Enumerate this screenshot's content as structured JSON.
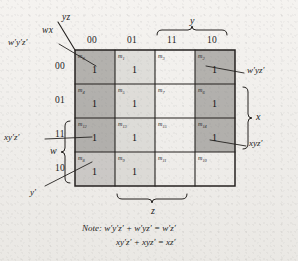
{
  "figure": {
    "type": "karnaugh-map",
    "variables": [
      "w",
      "x",
      "y",
      "z"
    ],
    "corner_label_top": "yz",
    "corner_label_bottom": "wx",
    "column_headers": [
      "00",
      "01",
      "11",
      "10"
    ],
    "row_headers": [
      "00",
      "01",
      "11",
      "10"
    ]
  },
  "braces": {
    "top": {
      "label": "y",
      "spans": [
        "11",
        "10"
      ]
    },
    "right": {
      "label": "x",
      "spans": [
        "01",
        "11"
      ]
    },
    "bottom": {
      "label": "z",
      "spans": [
        "01",
        "11"
      ]
    },
    "left": {
      "label": "w",
      "spans": [
        "11",
        "10"
      ]
    }
  },
  "cells": [
    {
      "minterm": "m",
      "index": "0",
      "value": "1",
      "shade": "dark"
    },
    {
      "minterm": "m",
      "index": "1",
      "value": "1",
      "shade": "light"
    },
    {
      "minterm": "m",
      "index": "3",
      "value": "",
      "shade": "none"
    },
    {
      "minterm": "m",
      "index": "2",
      "value": "1",
      "shade": "dark"
    },
    {
      "minterm": "m",
      "index": "4",
      "value": "1",
      "shade": "dark"
    },
    {
      "minterm": "m",
      "index": "5",
      "value": "1",
      "shade": "light"
    },
    {
      "minterm": "m",
      "index": "7",
      "value": "",
      "shade": "none"
    },
    {
      "minterm": "m",
      "index": "6",
      "value": "1",
      "shade": "dark"
    },
    {
      "minterm": "m",
      "index": "12",
      "value": "1",
      "shade": "dark"
    },
    {
      "minterm": "m",
      "index": "13",
      "value": "1",
      "shade": "light"
    },
    {
      "minterm": "m",
      "index": "15",
      "value": "",
      "shade": "none"
    },
    {
      "minterm": "m",
      "index": "14",
      "value": "1",
      "shade": "dark"
    },
    {
      "minterm": "m",
      "index": "8",
      "value": "1",
      "shade": "mid"
    },
    {
      "minterm": "m",
      "index": "9",
      "value": "1",
      "shade": "light"
    },
    {
      "minterm": "m",
      "index": "11",
      "value": "",
      "shade": "none"
    },
    {
      "minterm": "m",
      "index": "10",
      "value": "",
      "shade": "none"
    }
  ],
  "annotations": {
    "top_left_term": "w′y′z′",
    "left_mid_term": "xy′z′",
    "left_bottom_term": "y′",
    "right_top_term": "w′yz′",
    "right_bottom_term": "xyz′"
  },
  "note": {
    "prefix": "Note:",
    "line1": "w′y′z′ + w′yz′ = w′z′",
    "line2": "xy′z′ + xyz′ = xz′"
  },
  "colors": {
    "paper": "#f1efec",
    "ink": "#1b1b1b",
    "shade_dark": "#787673",
    "shade_mid": "#969490",
    "shade_light": "#bab8b4"
  }
}
